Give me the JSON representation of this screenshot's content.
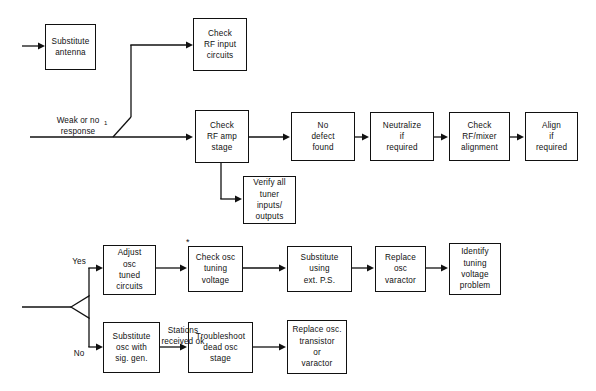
{
  "diagram": {
    "stroke_color": "#111111",
    "background_color": "#ffffff",
    "nodes": [
      {
        "id": "substitute_antenna",
        "label": "Substitute\nantenna"
      },
      {
        "id": "check_rf_input",
        "label": "Check\nRF input\ncircuits"
      },
      {
        "id": "check_rf_amp",
        "label": "Check\nRF amp\nstage"
      },
      {
        "id": "no_defect_found",
        "label": "No\ndefect\nfound"
      },
      {
        "id": "neutralize",
        "label": "Neutralize\nif\nrequired"
      },
      {
        "id": "check_alignment",
        "label": "Check\nRF/mixer\nalignment"
      },
      {
        "id": "align_if_required",
        "label": "Align\nif\nrequired"
      },
      {
        "id": "verify_tuner",
        "label": "Verify all\ntuner\ninputs/\noutputs"
      },
      {
        "id": "adjust_osc",
        "label": "Adjust\nosc\ntuned\ncircuits"
      },
      {
        "id": "check_osc_tuning",
        "label": "Check osc\ntuning\nvoltage"
      },
      {
        "id": "substitute_ext_ps",
        "label": "Substitute\nusing\next. P.S."
      },
      {
        "id": "replace_varactor",
        "label": "Replace\nosc\nvaractor"
      },
      {
        "id": "identify_problem",
        "label": "Identify\ntuning\nvoltage\nproblem"
      },
      {
        "id": "substitute_sig_gen",
        "label": "Substitute\nosc with\nsig. gen."
      },
      {
        "id": "troubleshoot_dead",
        "label": "Troubleshoot\ndead osc\nstage"
      },
      {
        "id": "replace_transistor",
        "label": "Replace osc.\ntransistor\nor\nvaractor"
      }
    ],
    "edge_labels": [
      {
        "id": "weak_or_no_response",
        "text": "Weak or no\nresponse"
      },
      {
        "id": "yes_branch",
        "text": "Yes"
      },
      {
        "id": "no_branch",
        "text": "No"
      },
      {
        "id": "stations_received",
        "text": "Stations\nreceived ok"
      }
    ],
    "markers": [
      {
        "id": "response_footnote",
        "text": "1"
      },
      {
        "id": "asterisk_note",
        "text": "*"
      }
    ]
  }
}
